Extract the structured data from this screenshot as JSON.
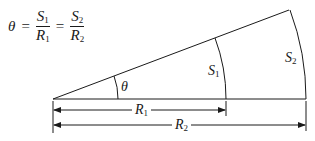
{
  "formula": {
    "lhs": "θ",
    "eq1": "=",
    "frac1": {
      "num": "S",
      "num_sub": "1",
      "den": "R",
      "den_sub": "1"
    },
    "eq2": "=",
    "frac2": {
      "num": "S",
      "num_sub": "2",
      "den": "R",
      "den_sub": "2"
    }
  },
  "labels": {
    "theta": "θ",
    "s1": "S",
    "s1_sub": "1",
    "s2": "S",
    "s2_sub": "2",
    "r1": "R",
    "r1_sub": "1",
    "r2": "R",
    "r2_sub": "2"
  }
}
